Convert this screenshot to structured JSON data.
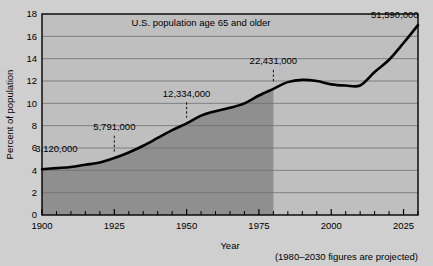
{
  "figure": {
    "background_color": "#cfcfcf",
    "plot_background_color": "#bfbfbf",
    "shaded_region_color": "#8f8f8f",
    "line_color": "#000000"
  },
  "chart_data": {
    "type": "area",
    "title": "U.S. population age 65 and older",
    "xlabel": "Year",
    "ylabel": "Percent of population",
    "xlim": [
      1900,
      2030
    ],
    "ylim": [
      0,
      18
    ],
    "ytick_step": 2,
    "yticks": [
      "0",
      "2",
      "4",
      "6",
      "8",
      "10",
      "12",
      "14",
      "16",
      "18"
    ],
    "xticks_major": [
      "1900",
      "1925",
      "1950",
      "1975",
      "2000",
      "2025"
    ],
    "xtick_minor_step": 5,
    "grid": "horizontal",
    "legend": "none",
    "x": [
      1900,
      1905,
      1910,
      1915,
      1920,
      1925,
      1930,
      1935,
      1940,
      1945,
      1950,
      1955,
      1960,
      1965,
      1970,
      1975,
      1980,
      1985,
      1990,
      1995,
      2000,
      2005,
      2010,
      2015,
      2020,
      2025,
      2030
    ],
    "y": [
      4.1,
      4.2,
      4.3,
      4.5,
      4.7,
      5.1,
      5.6,
      6.2,
      6.9,
      7.6,
      8.2,
      8.9,
      9.3,
      9.6,
      10.0,
      10.7,
      11.3,
      11.9,
      12.1,
      12.0,
      11.7,
      11.6,
      11.6,
      12.8,
      13.9,
      15.4,
      17.0
    ],
    "shaded_until_year": 1980,
    "annotations": [
      {
        "label": "3,120,000",
        "year": 1900,
        "text_x": 1905,
        "text_y": 5.6,
        "has_leader": false
      },
      {
        "label": "5,791,000",
        "year": 1925,
        "text_x": 1925,
        "text_y": 7.6,
        "has_leader": true,
        "leader_from_y": 7.1,
        "leader_to_y": 5.6
      },
      {
        "label": "12,334,000",
        "year": 1950,
        "text_x": 1950,
        "text_y": 10.6,
        "has_leader": true,
        "leader_from_y": 10.1,
        "leader_to_y": 8.7
      },
      {
        "label": "22,431,000",
        "year": 1980,
        "text_x": 1980,
        "text_y": 13.5,
        "has_leader": true,
        "leader_from_y": 13.0,
        "leader_to_y": 11.9
      },
      {
        "label": "51,590,000",
        "year": 2028,
        "text_x": 2022,
        "text_y": 17.6,
        "has_leader": false
      }
    ],
    "footnote": "(1980–2030 figures are projected)"
  }
}
